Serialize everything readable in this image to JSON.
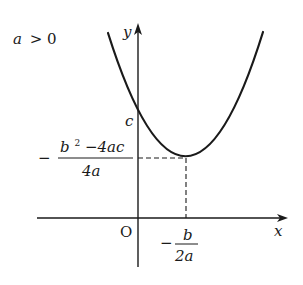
{
  "diagram": {
    "condition": {
      "a": "a",
      "op": ">",
      "zero": "0"
    },
    "axes": {
      "x_label": "x",
      "y_label": "y",
      "origin_label": "O"
    },
    "labels": {
      "y_intercept": "c",
      "vertex_y": {
        "sign": "−",
        "numerator_b": "b",
        "numerator_sq": "2",
        "numerator_rest": "−4ac",
        "denominator": "4a"
      },
      "vertex_x": {
        "sign": "−",
        "numerator": "b",
        "denominator": "2a"
      }
    },
    "curve": {
      "type": "parabola",
      "opens": "upward",
      "vertex_px": [
        186,
        158
      ],
      "y_intercept_px": [
        138,
        118
      ],
      "left_end_px": [
        108,
        33
      ],
      "right_end_px": [
        263,
        32
      ]
    },
    "colors": {
      "stroke": "#1a1a1a",
      "background": "#ffffff"
    }
  }
}
